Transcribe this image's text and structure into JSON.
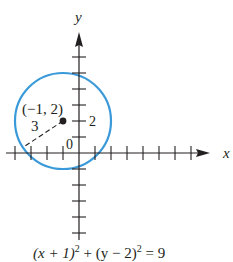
{
  "figure": {
    "axes": {
      "x_label": "x",
      "y_label": "y",
      "origin_label": "0",
      "y_tick_label": "2"
    },
    "center": {
      "label": "(−1, 2)",
      "x": -1,
      "y": 2
    },
    "radius": {
      "label": "3",
      "value": 3
    },
    "equation": {
      "part1": "(x + 1)",
      "exp1": "2",
      "part2": " + (y − 2)",
      "exp2": "2",
      "part3": " = 9"
    },
    "colors": {
      "circle": "#3a9ad9",
      "ink": "#231f20"
    }
  }
}
